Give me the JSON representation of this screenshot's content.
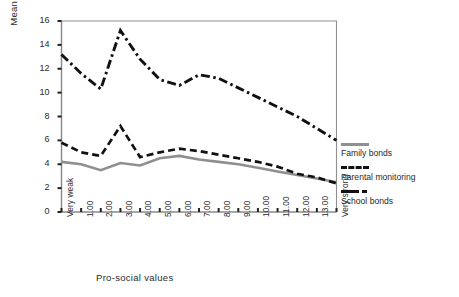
{
  "chart_data": {
    "type": "line",
    "title": "",
    "xlabel": "Pro-social values",
    "ylabel": "Mean scores for monitoring and bonds",
    "categories": [
      "Very weak",
      "1.00",
      "2.00",
      "3.00",
      "4.00",
      "5.00",
      "6.00",
      "7.00",
      "8.00",
      "9.00",
      "10.00",
      "11.00",
      "12.00",
      "13.00",
      "Very strong"
    ],
    "ylim": [
      0,
      16
    ],
    "yticks": [
      0,
      2,
      4,
      6,
      8,
      10,
      12,
      14,
      16
    ],
    "ytick_labels": [
      "0",
      "2",
      "4",
      "6",
      "8",
      "10",
      "12",
      "14",
      "16"
    ],
    "grid": false,
    "legend_position": "right",
    "series": [
      {
        "name": "Family bonds",
        "color": "#8f8f8f",
        "style": "solid",
        "values": [
          4.2,
          4.0,
          3.5,
          4.1,
          3.9,
          4.5,
          4.7,
          4.4,
          4.2,
          4.0,
          3.7,
          3.4,
          3.1,
          2.8,
          2.5
        ]
      },
      {
        "name": "Parental monitoring",
        "color": "#111111",
        "style": "dashed",
        "values": [
          5.8,
          5.0,
          4.7,
          7.2,
          4.6,
          5.0,
          5.3,
          5.1,
          4.8,
          4.5,
          4.2,
          3.8,
          3.2,
          2.9,
          2.4
        ]
      },
      {
        "name": "School bonds",
        "color": "#111111",
        "style": "dashdot",
        "values": [
          13.2,
          11.6,
          10.3,
          15.2,
          12.8,
          11.1,
          10.6,
          11.5,
          11.2,
          10.4,
          9.6,
          8.8,
          8.0,
          7.0,
          6.0
        ]
      }
    ]
  },
  "legend": {
    "items": [
      {
        "label": "Family bonds"
      },
      {
        "label": "Parental monitoring"
      },
      {
        "label": "School bonds"
      }
    ]
  }
}
